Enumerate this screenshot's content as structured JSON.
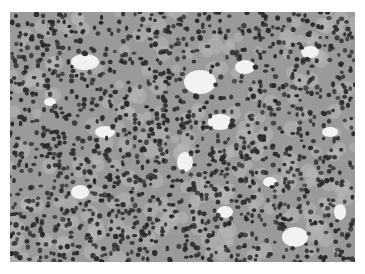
{
  "image": {
    "description": "Grayscale histology micrograph of densely packed cells with dark round nuclei and scattered light luminal spaces",
    "palette": {
      "background": "#ffffff",
      "tissue": "#9a9a9a",
      "cytoplasm": "#b5b5b5",
      "nucleus": "#2a2a2a",
      "lumen": "#f2f2f2"
    }
  }
}
